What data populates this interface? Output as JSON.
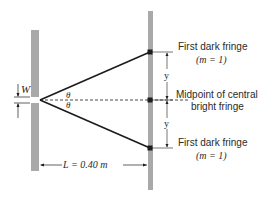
{
  "diagram": {
    "colors": {
      "screen": "#a9a9a9",
      "line": "#1c1c1c",
      "text": "#2a2a2a",
      "background": "#ffffff"
    },
    "slit": {
      "width_label": "W"
    },
    "angles": {
      "upper": "θ",
      "lower": "θ"
    },
    "distance": {
      "label": "L = 0.40 m"
    },
    "fringes": {
      "top": {
        "line1": "First dark fringe",
        "line2": "(m = 1)"
      },
      "middle": {
        "line1": "Midpoint of central",
        "line2": "bright fringe"
      },
      "bottom": {
        "line1": "First dark fringe",
        "line2": "(m = 1)"
      }
    },
    "y_labels": {
      "upper": "y",
      "lower": "y"
    }
  }
}
